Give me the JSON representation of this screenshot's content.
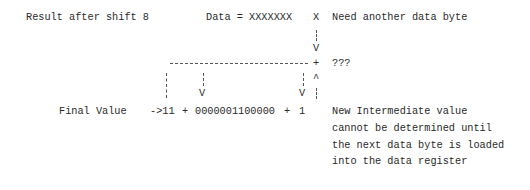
{
  "diagram": {
    "top_row": {
      "label": "Result after shift 8",
      "data_label": "Data = XXXXXXX",
      "next_bit": "X",
      "note": "Need another data byte"
    },
    "arrow_down": "V",
    "plus": "+",
    "unknown": "???",
    "caret": "^",
    "bottom_row": {
      "label": "Final Value",
      "arrow": "->11",
      "op1": "+",
      "binary_value": "0000001100000",
      "op2": "+",
      "addend": "1",
      "arrow_v1": "V",
      "arrow_v2": "V"
    },
    "explanation_lines": [
      "New Intermediate value",
      "cannot be determined until",
      "the next data byte is loaded",
      "into the data register"
    ]
  }
}
